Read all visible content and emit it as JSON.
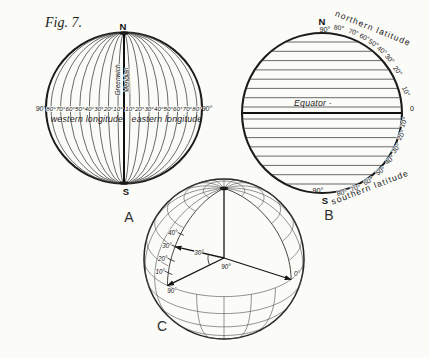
{
  "figure": {
    "label": "Fig. 7."
  },
  "colors": {
    "ink": "#222222",
    "paper": "#fbfbf8",
    "grid_line": "#4a4a4a"
  },
  "globe_a": {
    "label": "A",
    "north": "N",
    "south": "S",
    "prime_meridian_line1": "Greenwich",
    "prime_meridian_line2": "Meridian",
    "outer_left_tick": "90°",
    "outer_right_tick": "90°",
    "west_ticks": [
      "80°",
      "70°",
      "60°",
      "50°",
      "40°",
      "30°",
      "20°",
      "10°"
    ],
    "east_ticks": [
      "10°",
      "20°",
      "30°",
      "40°",
      "50°",
      "60°",
      "70°",
      "80°"
    ],
    "west_caption": "western longitude",
    "east_caption": "eastern longitude"
  },
  "globe_b": {
    "label": "B",
    "north": "N",
    "south": "S",
    "top_tick": "90°",
    "bottom_tick": "90°",
    "equator_tick": "0",
    "north_ticks": [
      "80°",
      "70°",
      "60°",
      "50°",
      "40°",
      "30°",
      "20°",
      "10°"
    ],
    "south_ticks": [
      "10°",
      "20°",
      "30°",
      "40°",
      "50°",
      "60°",
      "70°",
      "80°"
    ],
    "north_caption": "northern latitude",
    "south_caption": "southern latitude",
    "equator_label": "Equator ·"
  },
  "globe_c": {
    "label": "C",
    "latitude_ticks": [
      "10°",
      "20°",
      "30°",
      "40°"
    ],
    "latitude_angle_label": "30°",
    "longitude_angle_label": "90°",
    "west_point_label": "90°",
    "prime_point_label": "0°"
  }
}
